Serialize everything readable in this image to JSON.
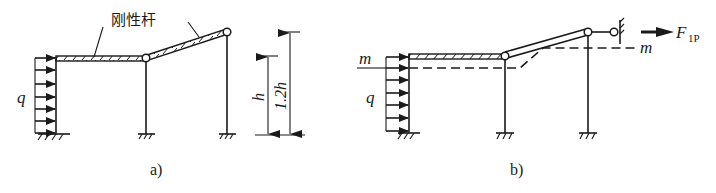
{
  "figure": {
    "panel_a": {
      "caption": "a)",
      "rigid_bar_label": "刚性杆",
      "load_label": "q",
      "dim_short_label": "h",
      "dim_tall_label": "1.2h"
    },
    "panel_b": {
      "caption": "b)",
      "load_label": "q",
      "section_label_left": "m",
      "section_label_right": "m",
      "force_label_main": "F",
      "force_label_sub": "1P"
    },
    "colors": {
      "ink": "#1a1a1a",
      "background": "#ffffff"
    }
  }
}
